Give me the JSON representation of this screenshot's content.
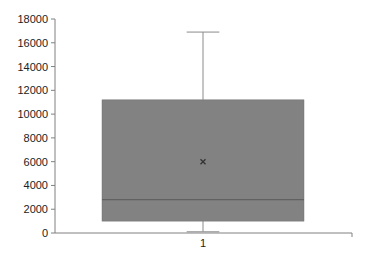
{
  "chart_data": {
    "type": "box",
    "title": "",
    "xlabel": "",
    "ylabel": "",
    "categories": [
      "1"
    ],
    "series": [
      {
        "name": "1",
        "min": 100,
        "q1": 1000,
        "median": 2800,
        "q3": 11200,
        "max": 16900,
        "mean": 6000
      }
    ],
    "ylim": [
      0,
      18000
    ],
    "yticks": [
      0,
      2000,
      4000,
      6000,
      8000,
      10000,
      12000,
      14000,
      16000,
      18000
    ],
    "ytick_labels": [
      "0",
      "2000",
      "4000",
      "6000",
      "8000",
      "10000",
      "12000",
      "14000",
      "16000",
      "18000"
    ],
    "grid": false,
    "legend": "none",
    "colors": {
      "box_fill": "#828282",
      "box_edge": "#6e6e6e",
      "median": "#5a5a5a",
      "whisker": "#8a8a8a",
      "axis": "#808080",
      "mean_marker": "#333333"
    }
  }
}
